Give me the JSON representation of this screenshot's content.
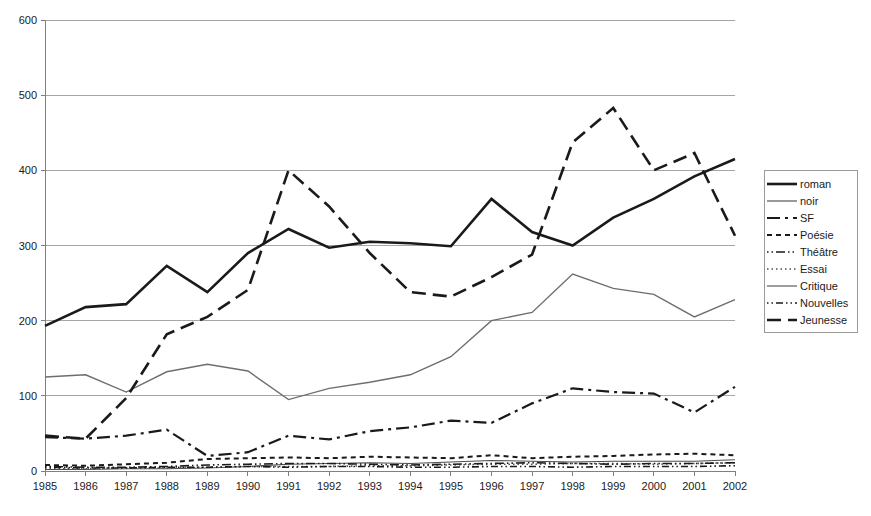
{
  "chart_data": {
    "type": "line",
    "title": "",
    "xlabel": "",
    "ylabel": "",
    "grid": true,
    "legend_position": "right",
    "xlim": [
      1985,
      2002
    ],
    "ylim": [
      0,
      600
    ],
    "yticks": [
      0,
      100,
      200,
      300,
      400,
      500,
      600
    ],
    "categories": [
      1985,
      1986,
      1987,
      1988,
      1989,
      1990,
      1991,
      1992,
      1993,
      1994,
      1995,
      1996,
      1997,
      1998,
      1999,
      2000,
      2001,
      2002
    ],
    "xtick_labels": [
      "1985",
      "1986",
      "1987",
      "1988",
      "1989",
      "1990",
      "1991",
      "1992",
      "1993",
      "1994",
      "1995",
      "1996",
      "1997",
      "1998",
      "1999",
      "2000",
      "2001",
      "2002"
    ],
    "ytick_labels": [
      "0",
      "100",
      "200",
      "300",
      "400",
      "500",
      "600"
    ],
    "series": [
      {
        "name": "roman",
        "style": "solid-thick",
        "color": "#1a1a1a",
        "width": 2.6,
        "dash": "",
        "values": [
          193,
          218,
          222,
          273,
          238,
          290,
          322,
          297,
          305,
          303,
          299,
          362,
          318,
          300,
          337,
          362,
          392,
          415
        ]
      },
      {
        "name": "noir",
        "style": "solid-thin",
        "color": "#6e6e6e",
        "width": 1.4,
        "dash": "",
        "values": [
          125,
          128,
          105,
          132,
          142,
          133,
          95,
          110,
          118,
          128,
          152,
          200,
          211,
          262,
          243,
          235,
          205,
          228
        ]
      },
      {
        "name": "SF",
        "style": "dash-dot-long",
        "color": "#1a1a1a",
        "width": 2.2,
        "dash": "13,5,3,5",
        "values": [
          45,
          43,
          47,
          55,
          20,
          25,
          47,
          42,
          53,
          58,
          67,
          64,
          90,
          110,
          105,
          103,
          78,
          112
        ]
      },
      {
        "name": "Poésie",
        "style": "dashed-short",
        "color": "#1a1a1a",
        "width": 2.0,
        "dash": "5,4",
        "values": [
          8,
          7,
          9,
          11,
          16,
          17,
          18,
          17,
          19,
          18,
          17,
          21,
          17,
          19,
          20,
          22,
          23,
          21
        ]
      },
      {
        "name": "Théâtre",
        "style": "dash-dot-dot",
        "color": "#1a1a1a",
        "width": 1.6,
        "dash": "1.5,3,1.5,3,9,3",
        "values": [
          6,
          5,
          5,
          6,
          8,
          9,
          10,
          10,
          9,
          8,
          9,
          10,
          11,
          10,
          9,
          10,
          10,
          11
        ]
      },
      {
        "name": "Essai",
        "style": "dotted",
        "color": "#4d4d4d",
        "width": 1.6,
        "dash": "1.5,3",
        "values": [
          3,
          3,
          4,
          4,
          5,
          6,
          6,
          6,
          7,
          7,
          8,
          9,
          9,
          10,
          10,
          9,
          10,
          11
        ]
      },
      {
        "name": "Critique",
        "style": "solid-hairline",
        "color": "#4d4d4d",
        "width": 1.1,
        "dash": "",
        "values": [
          2,
          2,
          3,
          3,
          4,
          6,
          9,
          10,
          11,
          10,
          12,
          14,
          13,
          12,
          13,
          13,
          13,
          15
        ]
      },
      {
        "name": "Nouvelles",
        "style": "dash-dot-dot-small",
        "color": "#1a1a1a",
        "width": 1.6,
        "dash": "1.5,3,1.5,3,7,3",
        "values": [
          5,
          4,
          4,
          5,
          5,
          6,
          5,
          6,
          6,
          5,
          5,
          6,
          6,
          5,
          6,
          6,
          6,
          7
        ]
      },
      {
        "name": "Jeunesse",
        "style": "dashed-long",
        "color": "#1a1a1a",
        "width": 2.6,
        "dash": "14,7",
        "values": [
          47,
          43,
          97,
          182,
          205,
          241,
          400,
          352,
          290,
          238,
          232,
          258,
          288,
          437,
          483,
          400,
          423,
          313
        ]
      }
    ]
  },
  "legend": {
    "items": [
      {
        "label": "roman"
      },
      {
        "label": "noir"
      },
      {
        "label": "SF"
      },
      {
        "label": "Poésie"
      },
      {
        "label": "Théâtre"
      },
      {
        "label": "Essai"
      },
      {
        "label": "Critique"
      },
      {
        "label": "Nouvelles"
      },
      {
        "label": "Jeunesse"
      }
    ]
  }
}
